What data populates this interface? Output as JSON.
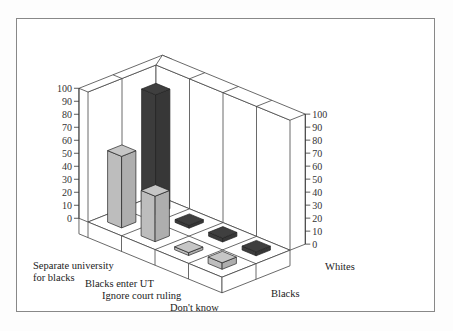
{
  "chart_data": {
    "type": "bar",
    "variant": "3d-grouped",
    "title": "",
    "categories": [
      "Separate university for blacks",
      "Blacks enter UT",
      "Ignore court ruling",
      "Don't know"
    ],
    "category_labels": [
      "Separate university",
      "for blacks",
      "Blacks enter UT",
      "Ignore court ruling",
      "Don't know"
    ],
    "series": [
      {
        "name": "Blacks",
        "color": "#bdbdbd",
        "values": [
          55,
          35,
          1,
          5
        ]
      },
      {
        "name": "Whites",
        "color": "#3c3c3c",
        "values": [
          92,
          2,
          3,
          3
        ]
      }
    ],
    "ylim": [
      0,
      100
    ],
    "yticks": [
      0,
      10,
      20,
      30,
      40,
      50,
      60,
      70,
      80,
      90,
      100
    ],
    "ylabel": "",
    "xlabel": "",
    "grid": true,
    "legend": "none (series labeled on depth axis)"
  },
  "labels": {
    "cat0_line1": "Separate university",
    "cat0_line2": "for blacks",
    "cat1": "Blacks enter UT",
    "cat2": "Ignore court ruling",
    "cat3": "Don't know",
    "series_front": "Blacks",
    "series_back": "Whites"
  },
  "ticks": [
    "100",
    "90",
    "80",
    "70",
    "60",
    "50",
    "40",
    "30",
    "20",
    "10",
    "0"
  ]
}
